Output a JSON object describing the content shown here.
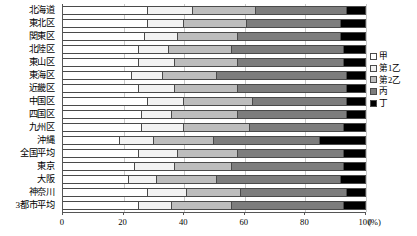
{
  "chart_data": {
    "type": "bar",
    "orientation": "horizontal",
    "stacked": true,
    "title": "",
    "xlabel": "(%)",
    "ylabel": "",
    "xlim": [
      0,
      100
    ],
    "grid": true,
    "legend_position": "right",
    "xticks": [
      "0",
      "20",
      "40",
      "60",
      "80",
      "100"
    ],
    "xtick_values": [
      0,
      20,
      40,
      60,
      80,
      100
    ],
    "unit_label": "(%)",
    "categories": [
      "北海道",
      "東北区",
      "関東区",
      "北陸区",
      "東山区",
      "東海区",
      "近畿区",
      "中国区",
      "四国区",
      "九州区",
      "沖縄",
      "全国平均",
      "東京",
      "大阪",
      "神奈川",
      "3都市平均"
    ],
    "series": [
      {
        "name": "甲",
        "color": "#ffffff",
        "values": [
          28,
          28,
          27,
          25,
          25,
          23,
          25,
          28,
          26,
          26,
          19,
          25,
          24,
          22,
          28,
          25
        ]
      },
      {
        "name": "第1乙",
        "color": "#f2f2f2",
        "values": [
          15,
          12,
          11,
          10,
          12,
          10,
          12,
          12,
          10,
          14,
          11,
          13,
          13,
          9,
          13,
          11
        ]
      },
      {
        "name": "第2乙",
        "color": "#bdbdbd",
        "values": [
          21,
          21,
          20,
          21,
          21,
          18,
          21,
          23,
          22,
          22,
          20,
          20,
          19,
          20,
          18,
          20
        ]
      },
      {
        "name": "丙",
        "color": "#7d7d7d",
        "values": [
          30,
          31,
          34,
          37,
          35,
          43,
          36,
          31,
          36,
          31,
          35,
          35,
          37,
          41,
          35,
          37
        ]
      },
      {
        "name": "丁",
        "color": "#000000",
        "values": [
          6,
          8,
          8,
          7,
          7,
          6,
          6,
          6,
          6,
          7,
          15,
          7,
          7,
          8,
          6,
          7
        ]
      }
    ]
  },
  "legend": {
    "items": [
      {
        "label": "甲",
        "color": "#ffffff"
      },
      {
        "label": "第1乙",
        "color": "#f2f2f2"
      },
      {
        "label": "第2乙",
        "color": "#bdbdbd"
      },
      {
        "label": "丙",
        "color": "#7d7d7d"
      },
      {
        "label": "丁",
        "color": "#000000"
      }
    ]
  }
}
